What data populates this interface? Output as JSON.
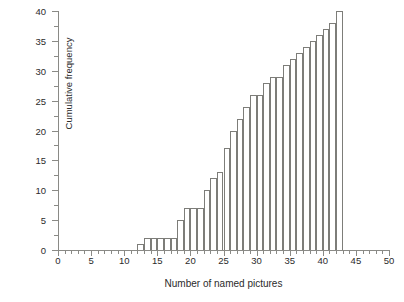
{
  "chart_data": {
    "type": "bar",
    "title": "",
    "xlabel": "Number of named pictures",
    "ylabel": "Cumulative frequency",
    "xlim": [
      0,
      50
    ],
    "ylim": [
      0,
      40
    ],
    "x_major_ticks": [
      0,
      5,
      10,
      15,
      20,
      25,
      30,
      35,
      40,
      45,
      50
    ],
    "x_tick_labels": [
      "0",
      "5",
      "10",
      "15",
      "20",
      "25",
      "30",
      "35",
      "40",
      "45",
      "50"
    ],
    "x_minor_tick_step": 1,
    "y_major_ticks": [
      0,
      5,
      10,
      15,
      20,
      25,
      30,
      35,
      40
    ],
    "y_tick_labels": [
      "0",
      "5",
      "10",
      "15",
      "20",
      "25",
      "30",
      "35",
      "40"
    ],
    "y_minor_tick_step": 2.5,
    "grid": false,
    "legend": false,
    "bar_fill": "#ffffff",
    "bar_edge": "#7d7d79",
    "axis_color": "#8a8a86",
    "categories": [
      12,
      13,
      14,
      15,
      16,
      17,
      18,
      19,
      20,
      21,
      22,
      23,
      24,
      25,
      26,
      27,
      28,
      29,
      30,
      31,
      32,
      33,
      34,
      35,
      36,
      37,
      38,
      39,
      40,
      41,
      42
    ],
    "values": [
      1,
      2,
      2,
      2,
      2,
      2,
      5,
      7,
      7,
      7,
      10,
      12,
      13,
      17,
      20,
      22,
      24,
      26,
      26,
      28,
      29,
      29,
      31,
      32,
      33,
      34,
      35,
      36,
      37,
      38,
      40
    ],
    "annotations": []
  }
}
